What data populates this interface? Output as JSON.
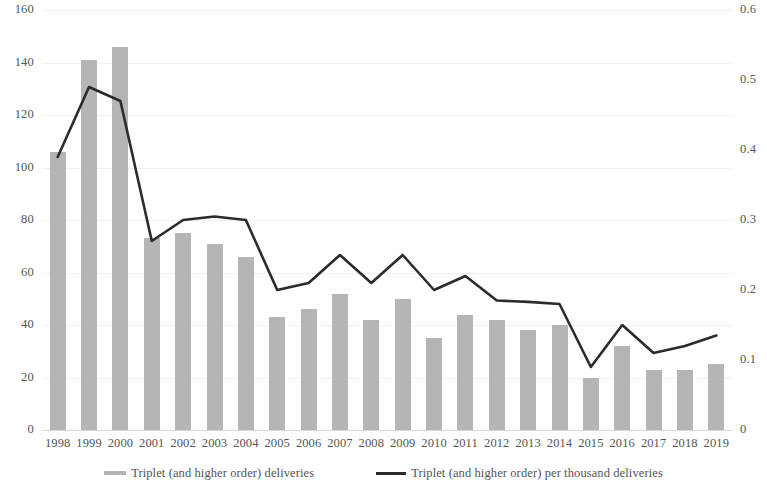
{
  "chart_data": {
    "type": "bar",
    "title": "",
    "subtitle": "",
    "xlabel": "",
    "ylabel": "",
    "grid": true,
    "legend_position": "bottom",
    "categories": [
      "1998",
      "1999",
      "2000",
      "2001",
      "2002",
      "2003",
      "2004",
      "2005",
      "2006",
      "2007",
      "2008",
      "2009",
      "2010",
      "2011",
      "2012",
      "2013",
      "2014",
      "2015",
      "2016",
      "2017",
      "2018",
      "2019"
    ],
    "axes": {
      "left": {
        "label": "",
        "min": 0,
        "max": 160,
        "step": 20,
        "ticks": [
          "0",
          "20",
          "40",
          "60",
          "80",
          "100",
          "120",
          "140",
          "160"
        ]
      },
      "right": {
        "label": "",
        "min": 0,
        "max": 0.6,
        "step": 0.1,
        "ticks": [
          "0",
          "0.1",
          "0.2",
          "0.3",
          "0.4",
          "0.5",
          "0.6"
        ]
      }
    },
    "series": [
      {
        "name": "Triplet (and higher order) deliveries",
        "type": "bar",
        "axis": "left",
        "color": "#b5b5b5",
        "values": [
          106,
          141,
          146,
          73,
          75,
          71,
          66,
          43,
          46,
          52,
          42,
          50,
          35,
          44,
          42,
          38,
          40,
          20,
          32,
          23,
          23,
          25
        ]
      },
      {
        "name": "Triplet (and higher order) per thousand deliveries",
        "type": "line",
        "axis": "right",
        "color": "#2b2b2b",
        "values": [
          0.39,
          0.49,
          0.47,
          0.27,
          0.3,
          0.305,
          0.3,
          0.2,
          0.21,
          0.25,
          0.21,
          0.25,
          0.2,
          0.22,
          0.185,
          0.183,
          0.18,
          0.09,
          0.15,
          0.11,
          0.12,
          0.135
        ]
      }
    ]
  },
  "legend": {
    "items": [
      {
        "label": "Triplet (and higher order) deliveries",
        "marker": "bar-swatch"
      },
      {
        "label": "Triplet (and higher order) per thousand deliveries",
        "marker": "line-swatch"
      }
    ]
  }
}
